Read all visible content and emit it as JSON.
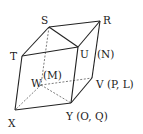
{
  "diagram": {
    "type": "3D polyhedron (folded cube net)",
    "vertices": {
      "S": {
        "x": 49,
        "y": 27,
        "label": "S"
      },
      "R": {
        "x": 100,
        "y": 21,
        "label": "R"
      },
      "T": {
        "x": 22,
        "y": 56,
        "label": "T"
      },
      "U": {
        "x": 78,
        "y": 47,
        "label": "U"
      },
      "W": {
        "x": 41,
        "y": 85,
        "label": "W"
      },
      "V": {
        "x": 92,
        "y": 78,
        "label": "V"
      },
      "X": {
        "x": 15,
        "y": 110,
        "label": "X"
      },
      "Y": {
        "x": 71,
        "y": 103,
        "label": "Y"
      }
    },
    "labels": {
      "S": "S",
      "R": "R",
      "T": "T",
      "U": "U",
      "N": "(N)",
      "W": "W",
      "M": "(M)",
      "V": "V (P, L)",
      "X": "X",
      "Y": "Y (O, Q)"
    },
    "solid_edges": [
      [
        "S",
        "R"
      ],
      [
        "S",
        "T"
      ],
      [
        "S",
        "U"
      ],
      [
        "R",
        "U"
      ],
      [
        "T",
        "U"
      ],
      [
        "T",
        "X"
      ],
      [
        "U",
        "Y"
      ],
      [
        "R",
        "V"
      ],
      [
        "V",
        "Y"
      ],
      [
        "X",
        "Y"
      ]
    ],
    "hidden_edges": [
      [
        "S",
        "W"
      ],
      [
        "W",
        "X"
      ],
      [
        "W",
        "V"
      ],
      [
        "W",
        "Y"
      ]
    ]
  }
}
